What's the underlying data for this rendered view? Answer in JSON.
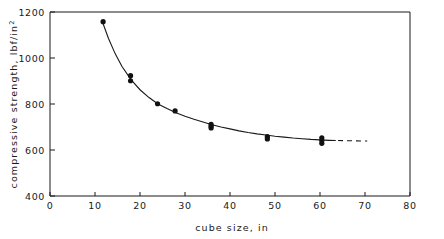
{
  "chart_data": {
    "type": "scatter",
    "title": "",
    "xlabel": "cube size, in",
    "ylabel": "compressive strength, lbf/in",
    "ylabel_superscript": "2",
    "xlim": [
      0,
      80
    ],
    "ylim": [
      400,
      1200
    ],
    "xticks": [
      0,
      10,
      20,
      30,
      40,
      50,
      60,
      70,
      80
    ],
    "yticks": [
      400,
      600,
      800,
      1000,
      1200
    ],
    "xtick_labels": [
      "0",
      "10",
      "20",
      "30",
      "40",
      "50",
      "60",
      "70",
      "80"
    ],
    "ytick_labels": [
      "400",
      "600",
      "800",
      "1000",
      "1200"
    ],
    "grid": false,
    "legend": "none",
    "marker": "filled-circle",
    "points": [
      {
        "x": 11.8,
        "y": 1158
      },
      {
        "x": 17.9,
        "y": 923
      },
      {
        "x": 17.9,
        "y": 901
      },
      {
        "x": 23.9,
        "y": 801
      },
      {
        "x": 27.8,
        "y": 770
      },
      {
        "x": 35.8,
        "y": 712
      },
      {
        "x": 35.8,
        "y": 703
      },
      {
        "x": 35.8,
        "y": 696
      },
      {
        "x": 48.3,
        "y": 658
      },
      {
        "x": 48.3,
        "y": 648
      },
      {
        "x": 60.4,
        "y": 653
      },
      {
        "x": 60.4,
        "y": 641
      },
      {
        "x": 60.4,
        "y": 629
      }
    ],
    "fit_curve": {
      "style": "solid",
      "x_range": [
        11.5,
        63.5
      ],
      "points": [
        {
          "x": 11.5,
          "y": 1165
        },
        {
          "x": 13.0,
          "y": 1085
        },
        {
          "x": 14.5,
          "y": 1018
        },
        {
          "x": 16.0,
          "y": 963
        },
        {
          "x": 18.0,
          "y": 906
        },
        {
          "x": 20.0,
          "y": 862
        },
        {
          "x": 22.0,
          "y": 828
        },
        {
          "x": 24.0,
          "y": 800
        },
        {
          "x": 26.0,
          "y": 780
        },
        {
          "x": 28.0,
          "y": 762
        },
        {
          "x": 30.0,
          "y": 747
        },
        {
          "x": 32.0,
          "y": 734
        },
        {
          "x": 34.0,
          "y": 722
        },
        {
          "x": 36.0,
          "y": 710
        },
        {
          "x": 38.0,
          "y": 700
        },
        {
          "x": 40.0,
          "y": 692
        },
        {
          "x": 42.0,
          "y": 683
        },
        {
          "x": 44.0,
          "y": 676
        },
        {
          "x": 46.0,
          "y": 670
        },
        {
          "x": 48.0,
          "y": 665
        },
        {
          "x": 50.0,
          "y": 660
        },
        {
          "x": 52.0,
          "y": 656
        },
        {
          "x": 54.0,
          "y": 652
        },
        {
          "x": 56.0,
          "y": 649
        },
        {
          "x": 58.0,
          "y": 646
        },
        {
          "x": 60.0,
          "y": 644
        },
        {
          "x": 62.0,
          "y": 642
        },
        {
          "x": 63.5,
          "y": 641
        }
      ]
    },
    "extrapolation_curve": {
      "style": "dashed",
      "points": [
        {
          "x": 64.0,
          "y": 641
        },
        {
          "x": 70.5,
          "y": 639
        }
      ]
    }
  }
}
